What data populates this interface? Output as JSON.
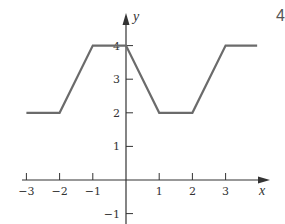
{
  "chart_data": {
    "type": "line",
    "title": "",
    "xlabel": "x",
    "ylabel": "y",
    "x_ticks": [
      "-3",
      "-2",
      "-1",
      "1",
      "2",
      "3"
    ],
    "y_ticks": [
      "-1",
      "1",
      "2",
      "3",
      "4"
    ],
    "xlim": [
      -3.2,
      4.3
    ],
    "ylim": [
      -1.3,
      4.9
    ],
    "grid": false,
    "legend": null,
    "series": [
      {
        "name": "f(x)",
        "x": [
          -3,
          -2,
          -1,
          0,
          1,
          2,
          3,
          3.95
        ],
        "y": [
          2,
          2,
          4,
          4,
          2,
          2,
          4,
          4
        ]
      }
    ],
    "corner_label": "4"
  },
  "style": {
    "line_color": "#6b6b6b",
    "axis_color": "#333333"
  }
}
